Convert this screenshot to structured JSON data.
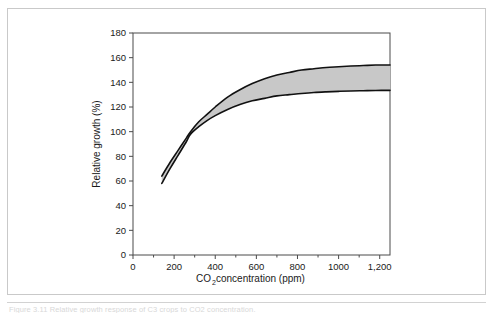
{
  "figure": {
    "caption": "Figure 3.11  Relative growth response of C3 crops to CO2 concentration.",
    "border_color": "#c9c9c9",
    "background": "#ffffff"
  },
  "chart_data": {
    "type": "area",
    "title": "",
    "subtitle": "",
    "xlabel": "CO2 concentration (ppm)",
    "xlabel_main": "CO",
    "xlabel_sub": "2",
    "xlabel_rest": " concentration (ppm)",
    "ylabel": "Relative growth (%)",
    "xlim": [
      0,
      1250
    ],
    "ylim": [
      0,
      180
    ],
    "grid": false,
    "legend": "none",
    "x_ticks": [
      0,
      200,
      400,
      600,
      800,
      1000,
      1200
    ],
    "x_tick_labels": [
      "0",
      "200",
      "400",
      "600",
      "800",
      "1000",
      "1,200"
    ],
    "x_minor_ticks": [
      100,
      300,
      500,
      700,
      900,
      1100
    ],
    "y_ticks": [
      0,
      20,
      40,
      60,
      80,
      100,
      120,
      140,
      160,
      180
    ],
    "y_tick_labels": [
      "0",
      "20",
      "40",
      "60",
      "80",
      "100",
      "120",
      "140",
      "160",
      "180"
    ],
    "band_fill_color": "#c8c8c8",
    "line_color": "#111111",
    "line_width": 1.6,
    "x": [
      140,
      180,
      220,
      260,
      280,
      320,
      360,
      400,
      460,
      520,
      580,
      640,
      700,
      760,
      820,
      880,
      940,
      1000,
      1060,
      1120,
      1180,
      1250
    ],
    "series": [
      {
        "name": "Upper bound",
        "values": [
          64,
          75,
          85,
          95,
          100,
          108,
          114,
          120,
          128,
          134,
          139,
          143,
          146,
          148,
          150,
          151,
          152,
          152.6,
          153.2,
          153.6,
          154,
          154
        ]
      },
      {
        "name": "Lower bound",
        "values": [
          58,
          70,
          81,
          92,
          98,
          104,
          109,
          113,
          118,
          122,
          125,
          127,
          129,
          130,
          131,
          131.8,
          132.3,
          132.7,
          133,
          133.2,
          133.4,
          133.5
        ]
      }
    ],
    "annotations": [
      {
        "text": "curves converge near 280 ppm at 100% relative growth",
        "x": 280,
        "y": 100
      }
    ]
  }
}
